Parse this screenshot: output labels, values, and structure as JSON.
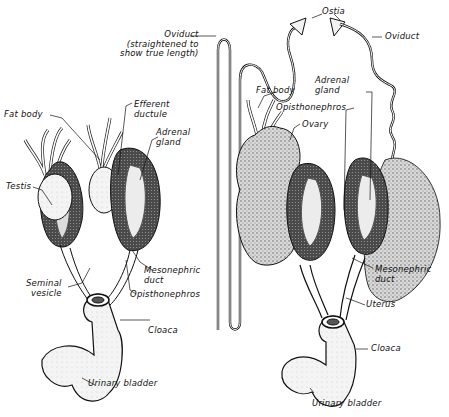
{
  "diagram": {
    "type": "anatomical-illustration",
    "colors": {
      "ink": "#111111",
      "organ_dark": "#3a3a3a",
      "organ_mid": "#7a7a7a",
      "organ_light": "#e8e8e8",
      "background": "#ffffff"
    },
    "male": {
      "labels": {
        "fat_body": "Fat body",
        "efferent_ductule": "Efferent\nductule",
        "adrenal_gland": "Adrenal\ngland",
        "testis": "Testis",
        "mesonephric_duct": "Mesonephric\nduct",
        "seminal_vesicle": "Seminal\nvesicle",
        "opisthonephros": "Opisthonephros",
        "cloaca": "Cloaca",
        "urinary_bladder": "Urinary bladder"
      }
    },
    "female": {
      "labels": {
        "oviduct_straightened": "Oviduct\n(straightened to\nshow true length)",
        "ostia": "Ostia",
        "oviduct": "Oviduct",
        "fat_body": "Fat body",
        "adrenal_gland": "Adrenal\ngland",
        "opisthonephros": "Opisthonephros",
        "ovary": "Ovary",
        "mesonephric_duct": "Mesonephric\nduct",
        "uterus": "Uterus",
        "cloaca": "Cloaca",
        "urinary_bladder": "Urinary bladder"
      }
    }
  }
}
